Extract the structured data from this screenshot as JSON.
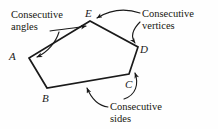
{
  "figure": {
    "name": "consecutive-parts-of-a-pentagon-diagram",
    "background_color": "#fefefe",
    "stroke_color": "#1a1a1a",
    "polygon": {
      "name": "pentagon-ABCDE",
      "vertices": [
        {
          "label": "A",
          "x": 29,
          "y": 58
        },
        {
          "label": "B",
          "x": 47,
          "y": 88
        },
        {
          "label": "C",
          "x": 129,
          "y": 74
        },
        {
          "label": "D",
          "x": 138,
          "y": 47
        },
        {
          "label": "E",
          "x": 90,
          "y": 21
        }
      ],
      "sides": [
        {
          "from": "A",
          "to": "B"
        },
        {
          "from": "B",
          "to": "C"
        },
        {
          "from": "C",
          "to": "D"
        },
        {
          "from": "D",
          "to": "E"
        },
        {
          "from": "E",
          "to": "A"
        }
      ]
    },
    "vertex_labels": [
      {
        "id": "A",
        "text": "A"
      },
      {
        "id": "B",
        "text": "B"
      },
      {
        "id": "C",
        "text": "C"
      },
      {
        "id": "D",
        "text": "D"
      },
      {
        "id": "E",
        "text": "E"
      }
    ],
    "callouts": [
      {
        "id": "angles",
        "line1": "Consecutive",
        "line2": "angles",
        "points_to": [
          "angle-at-E",
          "angle-at-A"
        ]
      },
      {
        "id": "vertices",
        "line1": "Consecutive",
        "line2": "vertices",
        "points_to": [
          "vertex-E",
          "vertex-D"
        ]
      },
      {
        "id": "sides",
        "line1": "Consecutive",
        "line2": "sides",
        "points_to": [
          "side-BC",
          "side-CD"
        ]
      }
    ]
  }
}
